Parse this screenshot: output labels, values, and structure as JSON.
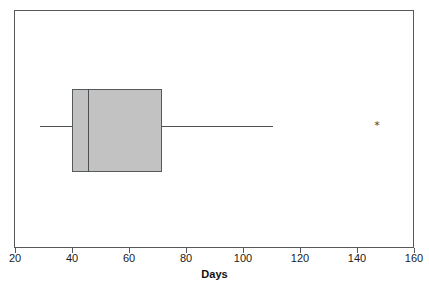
{
  "chart_data": {
    "type": "box",
    "title": "",
    "xlabel": "Days",
    "ylabel": "",
    "orientation": "horizontal",
    "xlim": [
      20,
      160
    ],
    "xticks": [
      20,
      40,
      60,
      80,
      100,
      120,
      140,
      160
    ],
    "xtick_labels": [
      "20",
      "40",
      "60",
      "80",
      "100",
      "120",
      "140",
      "160"
    ],
    "grid": false,
    "legend": null,
    "box_fill_color": "#c2c2c2",
    "box_line_color": "#555a5d",
    "frame_color": "#55595c",
    "outlier_marker": "*",
    "series": [
      {
        "name": "Days",
        "min_whisker": 28.7,
        "q1": 40.0,
        "median": 45.5,
        "q3": 71.5,
        "max_whisker": 110.5,
        "outliers": [
          147.0
        ]
      }
    ]
  },
  "axis": {
    "label": "Days",
    "tick_labels": [
      "20",
      "40",
      "60",
      "80",
      "100",
      "120",
      "140",
      "160"
    ]
  },
  "figure": {
    "title": ""
  }
}
